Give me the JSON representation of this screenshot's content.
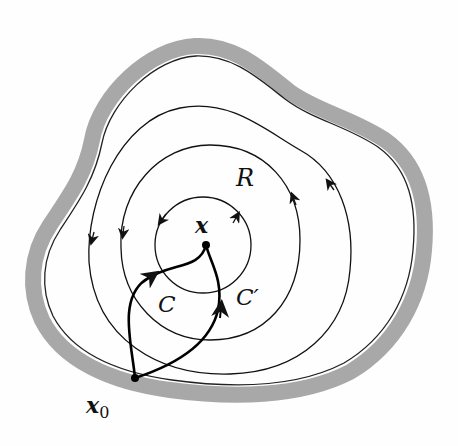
{
  "diagram": {
    "labels": {
      "region": "R",
      "point": "x",
      "base_point": "x",
      "base_subscript": "0",
      "path_c": "C",
      "path_c_prime": "C′"
    },
    "colors": {
      "background": "#fefefe",
      "boundary_band": "#a8a8a8",
      "line": "#111111"
    },
    "elements": [
      "region boundary (gray band with inner black edge)",
      "three nested closed contours around x with direction arrows",
      "path C from x0 to x",
      "path C' from x0 to x"
    ]
  }
}
